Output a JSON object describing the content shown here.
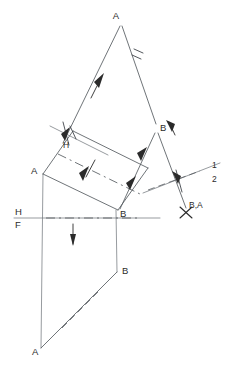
{
  "drawing": {
    "title": "Descriptive geometry true-length / point-view construction",
    "type": "engineering-line-drawing",
    "canvas": {
      "width": 237,
      "height": 370
    },
    "colors": {
      "background": "#ffffff",
      "line": "#555b60",
      "thin_line": "#6a7076",
      "label": "#2b2b2b",
      "arrow": "#2b2b2b"
    }
  },
  "labels": {
    "auxiliary_apex_a": "A",
    "auxiliary_b": "B",
    "horizontal_a": "A",
    "horizontal_b": "B",
    "frontal_b": "B",
    "frontal_a": "A",
    "point_view_ba": "B,A",
    "fold_h": "H",
    "fold_f": "F",
    "fold_aux_h": "H",
    "fold_aux_1": "1",
    "fold_line_1": "1",
    "fold_line_2": "2"
  },
  "points": {
    "auxiliary_apex_a": {
      "x": 120,
      "y": 22,
      "label": "A"
    },
    "auxiliary_b": {
      "x": 158,
      "y": 128,
      "label": "B"
    },
    "horizontal_a": {
      "x": 38,
      "y": 172,
      "label": "A"
    },
    "horizontal_b": {
      "x": 118,
      "y": 213,
      "label": "B"
    },
    "frontal_b": {
      "x": 120,
      "y": 272,
      "label": "B"
    },
    "frontal_a": {
      "x": 35,
      "y": 350,
      "label": "A"
    },
    "point_view_ba": {
      "x": 186,
      "y": 212,
      "label": "B,A"
    }
  },
  "fold_lines": {
    "hf": {
      "upper": "H",
      "lower": "F",
      "orientation": "horizontal"
    },
    "h1": {
      "upper": "1",
      "lower": "H",
      "orientation": "oblique"
    },
    "one_two": {
      "upper": "1",
      "lower": "2",
      "orientation": "oblique"
    }
  },
  "tick_marks": {
    "single": "I",
    "double": "II",
    "meaning": "equal-transfer-distance"
  },
  "arrows": {
    "count": 8,
    "meaning": "projection-transfer-direction"
  }
}
